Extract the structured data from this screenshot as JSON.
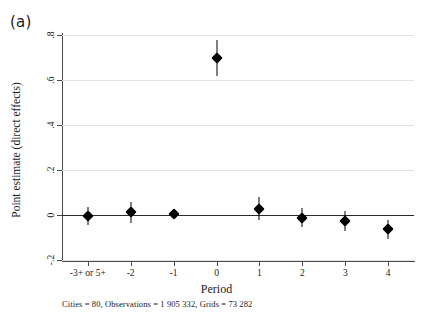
{
  "panel": {
    "label": "(a)"
  },
  "caption": {
    "text": "Cities = 80, Observations = 1 905 332, Grids = 73 282"
  },
  "chart_data": {
    "type": "scatter",
    "title": "",
    "subtitle": "",
    "xlabel": "Period",
    "ylabel": "Point estimate (direct effects)",
    "grid": true,
    "legend": "none",
    "xlim": [
      -0.6,
      7.6
    ],
    "ylim": [
      -0.2,
      0.8
    ],
    "yticks": [
      0.8,
      0.6,
      0.4,
      0.2,
      0,
      -0.2
    ],
    "ytick_labels": [
      ".8",
      ".6",
      ".4",
      ".2",
      "0",
      "-.2"
    ],
    "categories": [
      "-3+ or 5+",
      "-2",
      "-1",
      "0",
      "1",
      "2",
      "3",
      "4"
    ],
    "x": [
      0,
      1,
      2,
      3,
      4,
      5,
      6,
      7
    ],
    "zero_reference_line": 0,
    "series": [
      {
        "name": "Point estimate (direct effects)",
        "marker": "diamond",
        "color": "#000000",
        "values": [
          -0.005,
          0.012,
          0.004,
          0.7,
          0.028,
          -0.012,
          -0.027,
          -0.062
        ],
        "ci_low": [
          -0.045,
          -0.035,
          -0.012,
          0.62,
          -0.022,
          -0.052,
          -0.07,
          -0.105
        ],
        "ci_high": [
          0.035,
          0.06,
          0.02,
          0.78,
          0.078,
          0.03,
          0.016,
          -0.02
        ]
      }
    ]
  }
}
